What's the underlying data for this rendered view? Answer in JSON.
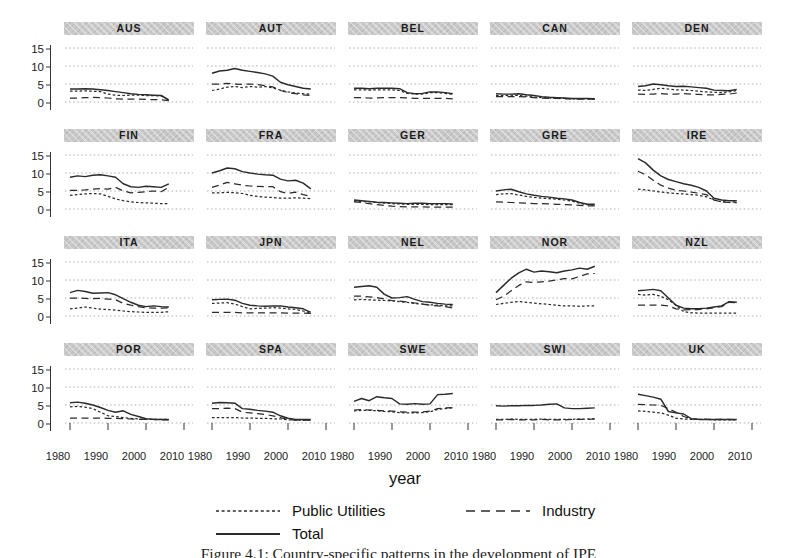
{
  "figure": {
    "xlabel": "year",
    "caption": "Figure 4.1: Country-specific patterns in the development of IPE"
  },
  "colors": {
    "line": "#2b2b2b",
    "grid": "#9a9a9a",
    "header_bg": "#c9c9c9",
    "background": "#ffffff"
  },
  "legend": [
    {
      "label": "Public Utilities",
      "style": "dotted"
    },
    {
      "label": "Industry",
      "style": "dashed"
    },
    {
      "label": "Total",
      "style": "solid"
    }
  ],
  "chart_data": {
    "type": "line",
    "layout": {
      "rows": 4,
      "cols": 5,
      "legend_position": "bottom",
      "grid": "horizontal-dotted"
    },
    "xlabel": "year",
    "x_ticks": [
      1980,
      1990,
      2000,
      2010
    ],
    "y_ticks": [
      0,
      5,
      10,
      15
    ],
    "xlim": [
      1979,
      2011
    ],
    "ylim": [
      0,
      15
    ],
    "x": [
      1980,
      1982,
      1984,
      1986,
      1988,
      1990,
      1992,
      1994,
      1996,
      1998,
      2000,
      2002,
      2004,
      2006
    ],
    "series_names": [
      "public_utilities",
      "industry",
      "total"
    ],
    "panels": [
      {
        "code": "AUS",
        "series": {
          "total": [
            3.6,
            3.6,
            3.7,
            3.6,
            3.4,
            3.2,
            2.9,
            2.6,
            2.3,
            2.1,
            2.0,
            1.9,
            1.8,
            0.6
          ],
          "industry": [
            1.1,
            1.1,
            1.2,
            1.3,
            1.2,
            1.1,
            0.9,
            0.8,
            0.8,
            0.8,
            0.7,
            0.7,
            0.6,
            0.4
          ],
          "public_utilities": [
            3.0,
            3.0,
            3.1,
            3.0,
            2.9,
            2.2,
            1.9,
            1.8,
            1.9,
            1.9,
            1.8,
            1.8,
            1.7,
            0.5
          ]
        }
      },
      {
        "code": "AUT",
        "series": {
          "total": [
            8.0,
            8.6,
            8.8,
            9.3,
            8.8,
            8.5,
            8.2,
            7.8,
            7.2,
            5.5,
            4.8,
            4.3,
            3.8,
            3.6
          ],
          "industry": [
            5.0,
            5.0,
            5.2,
            5.0,
            4.9,
            5.0,
            4.8,
            4.5,
            4.2,
            3.2,
            2.6,
            2.3,
            2.0,
            1.8
          ],
          "public_utilities": [
            3.2,
            3.6,
            4.1,
            4.3,
            4.0,
            4.3,
            4.1,
            4.3,
            3.9,
            3.3,
            2.8,
            2.5,
            2.3,
            2.2
          ]
        }
      },
      {
        "code": "BEL",
        "series": {
          "total": [
            3.8,
            3.8,
            3.7,
            3.8,
            3.8,
            3.8,
            3.7,
            2.6,
            2.3,
            2.4,
            2.8,
            2.8,
            2.6,
            2.3
          ],
          "industry": [
            1.2,
            1.2,
            1.1,
            1.1,
            1.2,
            1.2,
            1.2,
            1.1,
            1.0,
            1.0,
            1.0,
            1.0,
            1.0,
            0.9
          ],
          "public_utilities": [
            3.4,
            3.4,
            3.3,
            3.4,
            3.4,
            3.4,
            3.2,
            2.4,
            2.2,
            2.2,
            2.6,
            2.6,
            2.4,
            2.2
          ]
        }
      },
      {
        "code": "CAN",
        "series": {
          "total": [
            2.3,
            2.2,
            2.2,
            2.3,
            2.0,
            1.8,
            1.5,
            1.3,
            1.2,
            1.1,
            1.0,
            1.0,
            1.0,
            0.9
          ],
          "industry": [
            1.5,
            1.5,
            1.5,
            1.5,
            1.4,
            1.2,
            1.1,
            1.0,
            1.0,
            0.9,
            0.9,
            0.8,
            0.8,
            0.8
          ],
          "public_utilities": [
            1.8,
            1.8,
            1.9,
            1.8,
            1.6,
            1.4,
            1.2,
            1.1,
            1.0,
            1.0,
            0.9,
            0.9,
            0.9,
            0.8
          ]
        }
      },
      {
        "code": "DEN",
        "series": {
          "total": [
            4.3,
            4.5,
            5.0,
            4.8,
            4.5,
            4.3,
            4.4,
            4.2,
            4.0,
            3.8,
            3.3,
            3.2,
            3.1,
            3.5
          ],
          "industry": [
            2.2,
            2.1,
            2.2,
            2.3,
            2.2,
            2.2,
            2.3,
            2.2,
            2.1,
            2.0,
            2.0,
            2.1,
            2.2,
            2.5
          ],
          "public_utilities": [
            3.3,
            3.2,
            3.5,
            3.8,
            3.6,
            3.4,
            3.3,
            3.2,
            3.0,
            2.8,
            2.7,
            2.6,
            2.8,
            3.2
          ]
        }
      },
      {
        "code": "FIN",
        "series": {
          "total": [
            8.8,
            9.2,
            9.0,
            9.4,
            9.5,
            9.2,
            8.8,
            7.0,
            6.2,
            6.0,
            6.3,
            6.2,
            6.0,
            7.0
          ],
          "industry": [
            5.2,
            5.2,
            5.3,
            5.5,
            5.7,
            5.5,
            6.0,
            5.0,
            4.5,
            4.6,
            4.8,
            5.0,
            4.8,
            6.0
          ],
          "public_utilities": [
            3.8,
            4.0,
            4.2,
            4.3,
            4.2,
            3.5,
            2.8,
            2.3,
            2.0,
            1.8,
            1.7,
            1.6,
            1.5,
            1.5
          ]
        }
      },
      {
        "code": "FRA",
        "series": {
          "total": [
            10.0,
            10.6,
            11.4,
            11.2,
            10.4,
            10.0,
            9.7,
            9.5,
            9.4,
            8.3,
            7.8,
            8.0,
            7.2,
            5.6
          ],
          "industry": [
            6.0,
            6.6,
            7.4,
            7.0,
            6.6,
            6.4,
            6.3,
            6.2,
            6.2,
            4.8,
            4.3,
            4.7,
            4.0,
            3.5
          ],
          "public_utilities": [
            4.5,
            4.5,
            4.6,
            4.5,
            4.3,
            3.8,
            3.5,
            3.3,
            3.2,
            3.0,
            3.0,
            3.1,
            3.0,
            2.9
          ]
        }
      },
      {
        "code": "GER",
        "series": {
          "total": [
            2.5,
            2.3,
            2.1,
            1.9,
            1.8,
            1.7,
            1.6,
            1.5,
            1.6,
            1.6,
            1.5,
            1.5,
            1.5,
            1.4
          ],
          "industry": [
            2.0,
            1.8,
            1.5,
            1.2,
            1.0,
            0.8,
            0.7,
            0.6,
            0.6,
            0.6,
            0.5,
            0.5,
            0.5,
            0.5
          ],
          "public_utilities": [
            2.2,
            2.1,
            2.0,
            1.8,
            1.6,
            1.5,
            1.4,
            1.3,
            1.3,
            1.3,
            1.2,
            1.2,
            1.2,
            1.2
          ]
        }
      },
      {
        "code": "GRE",
        "series": {
          "total": [
            5.0,
            5.3,
            5.5,
            4.8,
            4.2,
            3.8,
            3.5,
            3.3,
            3.0,
            2.8,
            2.5,
            1.8,
            1.3,
            1.3
          ],
          "industry": [
            2.0,
            1.9,
            1.8,
            1.7,
            1.6,
            1.5,
            1.5,
            1.4,
            1.3,
            1.2,
            1.1,
            1.0,
            0.9,
            0.9
          ],
          "public_utilities": [
            4.0,
            4.2,
            4.3,
            3.9,
            3.5,
            3.2,
            3.0,
            2.9,
            2.7,
            2.5,
            2.2,
            1.6,
            1.2,
            1.1
          ]
        }
      },
      {
        "code": "IRE",
        "series": {
          "total": [
            14.0,
            12.8,
            10.8,
            9.2,
            8.2,
            7.6,
            7.0,
            6.6,
            6.0,
            5.0,
            3.0,
            2.5,
            2.3,
            2.3
          ],
          "industry": [
            10.5,
            9.5,
            8.0,
            6.6,
            5.8,
            5.2,
            5.0,
            4.7,
            4.4,
            4.0,
            2.5,
            2.0,
            1.8,
            1.8
          ],
          "public_utilities": [
            5.5,
            5.3,
            5.0,
            4.7,
            4.5,
            4.3,
            4.2,
            4.0,
            3.8,
            3.4,
            2.5,
            2.0,
            1.8,
            2.0
          ]
        }
      },
      {
        "code": "ITA",
        "series": {
          "total": [
            6.5,
            7.1,
            6.8,
            6.3,
            6.4,
            6.5,
            5.9,
            4.8,
            3.8,
            3.0,
            2.6,
            2.8,
            2.6,
            2.5
          ],
          "industry": [
            5.0,
            5.0,
            4.9,
            4.8,
            4.9,
            4.7,
            4.5,
            3.5,
            3.0,
            2.6,
            2.3,
            2.2,
            2.2,
            2.3
          ],
          "public_utilities": [
            2.0,
            2.2,
            2.5,
            2.2,
            1.9,
            1.8,
            1.6,
            1.4,
            1.2,
            1.1,
            1.0,
            1.0,
            1.0,
            1.2
          ]
        }
      },
      {
        "code": "JPN",
        "series": {
          "total": [
            4.5,
            4.6,
            4.7,
            4.4,
            3.5,
            3.0,
            2.8,
            2.7,
            2.8,
            2.8,
            2.5,
            2.3,
            2.0,
            1.0
          ],
          "industry": [
            1.0,
            1.0,
            1.0,
            1.0,
            0.9,
            0.9,
            0.9,
            0.9,
            0.9,
            0.9,
            0.8,
            0.8,
            0.8,
            0.7
          ],
          "public_utilities": [
            3.5,
            3.6,
            3.7,
            3.3,
            2.6,
            2.0,
            2.1,
            2.2,
            2.3,
            2.2,
            2.0,
            1.8,
            1.4,
            0.8
          ]
        }
      },
      {
        "code": "NEL",
        "series": {
          "total": [
            8.0,
            8.2,
            8.4,
            8.0,
            6.0,
            5.0,
            5.1,
            5.4,
            4.6,
            4.0,
            3.8,
            3.5,
            3.3,
            3.2
          ],
          "industry": [
            5.5,
            5.5,
            5.3,
            5.1,
            4.7,
            4.3,
            4.1,
            3.9,
            3.6,
            3.3,
            3.0,
            2.8,
            2.6,
            2.2
          ],
          "public_utilities": [
            4.5,
            4.6,
            4.5,
            4.4,
            4.3,
            4.2,
            4.0,
            3.8,
            3.5,
            3.3,
            3.1,
            3.0,
            2.8,
            2.8
          ]
        }
      },
      {
        "code": "NOR",
        "series": {
          "total": [
            6.5,
            8.5,
            10.5,
            12.0,
            13.0,
            12.2,
            12.5,
            12.3,
            12.0,
            12.5,
            12.8,
            13.3,
            13.0,
            13.8
          ],
          "industry": [
            4.5,
            5.5,
            7.0,
            8.5,
            9.5,
            9.3,
            9.5,
            9.7,
            10.0,
            10.4,
            10.3,
            11.0,
            11.7,
            11.8
          ],
          "public_utilities": [
            3.2,
            3.5,
            3.8,
            4.0,
            3.8,
            3.6,
            3.4,
            3.2,
            3.0,
            2.8,
            2.8,
            2.7,
            2.8,
            2.8
          ]
        }
      },
      {
        "code": "NZL",
        "series": {
          "total": [
            7.0,
            7.2,
            7.4,
            7.0,
            5.0,
            3.0,
            2.2,
            2.0,
            2.0,
            2.2,
            2.5,
            2.8,
            4.0,
            3.8
          ],
          "industry": [
            3.0,
            3.0,
            3.0,
            3.0,
            2.8,
            2.0,
            1.7,
            1.8,
            1.8,
            2.0,
            2.3,
            2.6,
            3.8,
            3.7
          ],
          "public_utilities": [
            6.0,
            5.8,
            6.0,
            5.5,
            4.5,
            3.0,
            1.2,
            0.9,
            0.8,
            0.8,
            0.8,
            0.8,
            0.8,
            0.8
          ]
        }
      },
      {
        "code": "POR",
        "series": {
          "total": [
            5.6,
            5.8,
            5.5,
            5.0,
            4.3,
            3.5,
            3.0,
            3.4,
            2.4,
            1.8,
            1.2,
            1.0,
            1.0,
            1.0
          ],
          "industry": [
            1.4,
            1.4,
            1.4,
            1.4,
            1.4,
            1.3,
            1.3,
            1.2,
            1.1,
            1.0,
            1.0,
            1.0,
            0.9,
            0.9
          ],
          "public_utilities": [
            4.5,
            4.6,
            4.4,
            4.0,
            3.0,
            2.0,
            1.8,
            1.5,
            1.3,
            1.1,
            1.0,
            1.0,
            1.0,
            1.0
          ]
        }
      },
      {
        "code": "SPA",
        "series": {
          "total": [
            5.5,
            5.7,
            5.6,
            5.5,
            4.0,
            3.8,
            3.5,
            3.3,
            3.0,
            2.0,
            1.3,
            1.0,
            1.0,
            1.0
          ],
          "industry": [
            4.0,
            4.0,
            4.1,
            4.0,
            3.0,
            2.8,
            2.6,
            2.4,
            2.0,
            1.5,
            1.0,
            0.8,
            0.8,
            0.8
          ],
          "public_utilities": [
            1.5,
            1.5,
            1.5,
            1.5,
            1.4,
            1.4,
            1.3,
            1.3,
            1.2,
            1.1,
            0.9,
            0.8,
            0.8,
            0.8
          ]
        }
      },
      {
        "code": "SWE",
        "series": {
          "total": [
            6.0,
            6.8,
            6.2,
            7.3,
            7.0,
            6.8,
            5.3,
            5.2,
            5.4,
            5.2,
            5.3,
            7.9,
            8.0,
            8.2
          ],
          "industry": [
            3.6,
            3.7,
            3.6,
            3.5,
            3.4,
            3.3,
            3.1,
            3.0,
            3.0,
            3.1,
            3.3,
            4.0,
            4.2,
            4.3
          ],
          "public_utilities": [
            3.4,
            3.5,
            3.5,
            3.4,
            3.2,
            3.1,
            2.9,
            2.8,
            2.8,
            2.9,
            3.1,
            3.8,
            4.0,
            4.2
          ]
        }
      },
      {
        "code": "SWI",
        "series": {
          "total": [
            4.8,
            4.7,
            4.8,
            4.8,
            4.9,
            4.9,
            5.0,
            5.2,
            5.3,
            4.2,
            4.0,
            4.0,
            4.1,
            4.2
          ],
          "industry": [
            0.9,
            0.9,
            1.0,
            0.9,
            0.9,
            0.9,
            1.0,
            0.9,
            0.9,
            0.9,
            1.0,
            1.0,
            1.0,
            1.1
          ],
          "public_utilities": [
            1.0,
            1.0,
            1.1,
            1.0,
            1.0,
            1.0,
            1.1,
            1.0,
            1.0,
            1.0,
            1.0,
            1.1,
            1.1,
            1.2
          ]
        }
      },
      {
        "code": "UK",
        "series": {
          "total": [
            8.0,
            7.6,
            7.2,
            6.6,
            3.2,
            2.8,
            2.5,
            1.2,
            1.0,
            1.0,
            1.0,
            1.0,
            1.0,
            1.0
          ],
          "industry": [
            5.2,
            5.1,
            5.0,
            4.9,
            4.0,
            3.0,
            1.8,
            1.2,
            1.0,
            1.0,
            1.0,
            1.0,
            1.0,
            0.9
          ],
          "public_utilities": [
            3.4,
            3.2,
            3.0,
            2.8,
            2.2,
            1.3,
            1.1,
            1.0,
            1.0,
            1.0,
            0.9,
            0.9,
            0.9,
            0.9
          ]
        }
      }
    ]
  }
}
